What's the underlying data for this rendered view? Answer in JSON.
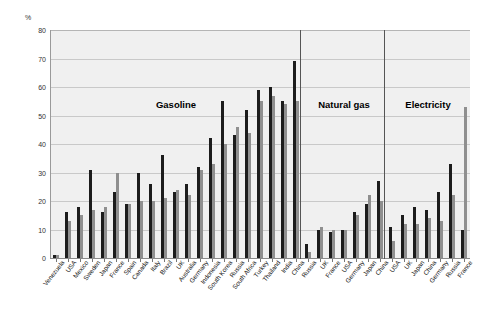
{
  "chart_data": {
    "type": "bar",
    "title": "",
    "xlabel": "",
    "ylabel": "%",
    "ylim": [
      0,
      80
    ],
    "yticks": [
      0,
      10,
      20,
      30,
      40,
      50,
      60,
      70,
      80
    ],
    "grid": true,
    "legend_position": "none",
    "y_unit_label": "%",
    "sections": [
      {
        "name": "Gasoline",
        "categories": [
          "Venezuela",
          "USA",
          "Mexico",
          "Sweden",
          "Japan",
          "France",
          "Spain",
          "Canada",
          "Italy",
          "Brazil",
          "UK",
          "Australia",
          "Germany",
          "Indonesia",
          "South Korea",
          "Russia",
          "South Africa",
          "Turkey",
          "Thailand",
          "India",
          "China"
        ],
        "series": [
          {
            "name": "series-dark",
            "values": [
              1,
              16,
              18,
              31,
              16,
              23,
              19,
              30,
              26,
              36,
              23,
              26,
              32,
              42,
              55,
              43,
              52,
              59,
              60,
              55,
              69
            ]
          },
          {
            "name": "series-light",
            "values": [
              1,
              13,
              15,
              17,
              18,
              30,
              19,
              20,
              20,
              21,
              24,
              22,
              31,
              33,
              40,
              46,
              44,
              55,
              57,
              54,
              55
            ]
          }
        ]
      },
      {
        "name": "Natural gas",
        "categories": [
          "Russia",
          "UK",
          "France",
          "USA",
          "Germany",
          "Japan",
          "China"
        ],
        "series": [
          {
            "name": "series-dark",
            "values": [
              5,
              10,
              9,
              10,
              16,
              19,
              27
            ]
          },
          {
            "name": "series-light",
            "values": [
              2,
              11,
              10,
              10,
              15,
              22,
              20
            ]
          }
        ]
      },
      {
        "name": "Electricity",
        "categories": [
          "USA",
          "UK",
          "Japan",
          "China",
          "Germany",
          "Russia",
          "France"
        ],
        "series": [
          {
            "name": "series-dark",
            "values": [
              11,
              15,
              18,
              17,
              23,
              33,
              10
            ]
          },
          {
            "name": "series-light",
            "values": [
              6,
              12,
              12,
              14,
              13,
              22,
              53
            ]
          }
        ]
      }
    ],
    "colors": {
      "series_dark": "#1c1c1c",
      "series_light": "#8f8f8f",
      "plot_background": "#f0f0f0",
      "gridline": "#c9c9c9",
      "divider": "#555555",
      "text": "#111111"
    }
  }
}
